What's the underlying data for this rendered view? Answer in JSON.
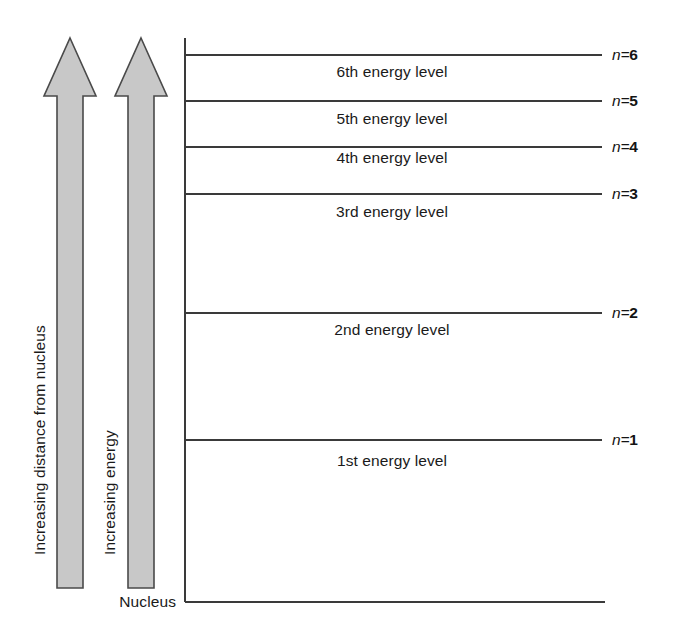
{
  "diagram": {
    "background_color": "#ffffff",
    "line_color": "#3a3a3a",
    "arrow_fill": "#c8c8c8",
    "arrow_stroke": "#4a4a4a",
    "text_color": "#1a1a1a"
  },
  "arrows": [
    {
      "id": "distance-arrow",
      "caption": "Increasing distance from nucleus",
      "tip_y": 38,
      "base_y": 588,
      "center_x": 70
    },
    {
      "id": "energy-arrow",
      "caption": "Increasing energy",
      "tip_y": 38,
      "base_y": 588,
      "center_x": 140
    }
  ],
  "axis": {
    "vertical_line_x": 185,
    "vertical_line_top": 38,
    "vertical_line_bottom": 602,
    "baseline_y": 602,
    "baseline_x_start": 185,
    "baseline_x_end": 605,
    "nucleus_label": "Nucleus",
    "nucleus_label_x": 178,
    "nucleus_label_y": 602
  },
  "levels": [
    {
      "n_symbol": "n",
      "n_equals": "=",
      "n_value": "6",
      "n_label": "n=6",
      "level_label": "6th energy level",
      "line_y": 55,
      "label_y": 72,
      "label_x": 392
    },
    {
      "n_symbol": "n",
      "n_equals": "=",
      "n_value": "5",
      "n_label": "n=5",
      "level_label": "5th energy level",
      "line_y": 101,
      "label_y": 119,
      "label_x": 392
    },
    {
      "n_symbol": "n",
      "n_equals": "=",
      "n_value": "4",
      "n_label": "n=4",
      "level_label": "4th energy level",
      "line_y": 147,
      "label_y": 158,
      "label_x": 392
    },
    {
      "n_symbol": "n",
      "n_equals": "=",
      "n_value": "3",
      "n_label": "n=3",
      "level_label": "3rd energy level",
      "line_y": 194,
      "label_y": 212,
      "label_x": 392
    },
    {
      "n_symbol": "n",
      "n_equals": "=",
      "n_value": "2",
      "n_label": "n=2",
      "level_label": "2nd energy level",
      "line_y": 313,
      "label_y": 330,
      "label_x": 392
    },
    {
      "n_symbol": "n",
      "n_equals": "=",
      "n_value": "1",
      "n_label": "n=1",
      "level_label": "1st energy level",
      "line_y": 440,
      "label_y": 461,
      "label_x": 392
    }
  ],
  "level_line_x_start": 185,
  "level_line_x_end": 602,
  "n_label_x": 612
}
